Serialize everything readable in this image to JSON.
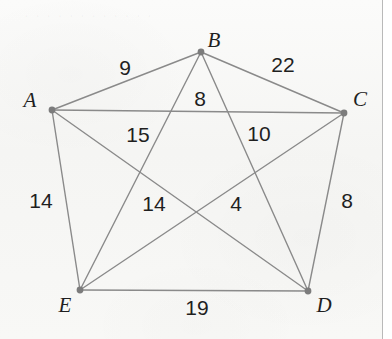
{
  "figure": {
    "type": "weighted-complete-graph",
    "background_color": "#f7f7f5",
    "edge_color": "#8a8a8a",
    "vertex_color": "#7c7c7c",
    "text_color": "#1f1f1f",
    "ghost_text": "· · · · · · · · · · · ·"
  },
  "chart_data": {
    "type": "diagram",
    "title": "",
    "vertices": [
      {
        "id": "A",
        "label": "A",
        "x": 52,
        "y": 110,
        "label_x": 30,
        "label_y": 100
      },
      {
        "id": "B",
        "label": "B",
        "x": 201,
        "y": 52,
        "label_x": 214,
        "label_y": 40
      },
      {
        "id": "C",
        "label": "C",
        "x": 344,
        "y": 113,
        "label_x": 360,
        "label_y": 99
      },
      {
        "id": "D",
        "label": "D",
        "x": 308,
        "y": 291,
        "label_x": 324,
        "label_y": 305
      },
      {
        "id": "E",
        "label": "E",
        "x": 80,
        "y": 290,
        "label_x": 65,
        "label_y": 305
      }
    ],
    "edges": [
      {
        "from": "A",
        "to": "B",
        "weight": 9,
        "label_x": 125,
        "label_y": 67
      },
      {
        "from": "B",
        "to": "C",
        "weight": 22,
        "label_x": 283,
        "label_y": 64
      },
      {
        "from": "A",
        "to": "C",
        "weight": 8,
        "label_x": 200,
        "label_y": 98
      },
      {
        "from": "A",
        "to": "D",
        "weight": 15,
        "label_x": 138,
        "label_y": 134
      },
      {
        "from": "B",
        "to": "D",
        "weight": 10,
        "label_x": 259,
        "label_y": 133
      },
      {
        "from": "A",
        "to": "E",
        "weight": 14,
        "label_x": 41,
        "label_y": 200
      },
      {
        "from": "B",
        "to": "E",
        "weight": 14,
        "label_x": 154,
        "label_y": 203
      },
      {
        "from": "C",
        "to": "E",
        "weight": 4,
        "label_x": 236,
        "label_y": 203
      },
      {
        "from": "C",
        "to": "D",
        "weight": 8,
        "label_x": 347,
        "label_y": 200
      },
      {
        "from": "D",
        "to": "E",
        "weight": 19,
        "label_x": 197,
        "label_y": 307
      }
    ]
  }
}
